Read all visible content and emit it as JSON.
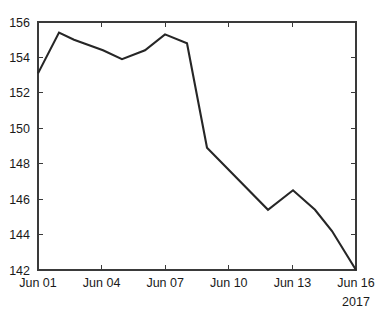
{
  "chart_data": {
    "type": "line",
    "title": "",
    "xlabel": "",
    "ylabel": "",
    "year_label": "2017",
    "grid": false,
    "legend": "none",
    "line_color": "#262626",
    "axis_color": "#3a3a3a",
    "background": "#ffffff",
    "xlim": [
      "Jun 01",
      "Jun 16"
    ],
    "ylim": [
      142,
      156
    ],
    "yticks": [
      142,
      144,
      146,
      148,
      150,
      152,
      154,
      156
    ],
    "ytick_labels": [
      "142",
      "144",
      "146",
      "148",
      "150",
      "152",
      "154",
      "156"
    ],
    "xticks": [
      "Jun 01",
      "Jun 04",
      "Jun 07",
      "Jun 10",
      "Jun 13",
      "Jun 16"
    ],
    "xtick_labels": [
      "Jun 01",
      "Jun 04",
      "Jun 07",
      "Jun 10",
      "Jun 13",
      "Jun 16"
    ],
    "x": [
      "Jun 01",
      "Jun 02",
      "Jun 03",
      "Jun 05",
      "Jun 06",
      "Jun 07",
      "Jun 08",
      "Jun 09",
      "Jun 10",
      "Jun 12",
      "Jun 13",
      "Jun 14",
      "Jun 15",
      "Jun 16"
    ],
    "values": [
      153.1,
      155.4,
      155.0,
      154.4,
      153.9,
      154.4,
      155.3,
      154.8,
      148.9,
      145.4,
      146.5,
      145.4,
      144.2,
      142.0
    ],
    "series": [
      {
        "name": "value",
        "values": [
          153.1,
          155.4,
          155.0,
          154.4,
          153.9,
          154.4,
          155.3,
          154.8,
          148.9,
          145.4,
          146.5,
          145.4,
          144.2,
          142.0
        ]
      }
    ],
    "points_px": [
      [
        38,
        73
      ],
      [
        59,
        32
      ],
      [
        74,
        40
      ],
      [
        103,
        50
      ],
      [
        122,
        58
      ],
      [
        145,
        49
      ],
      [
        165,
        34
      ],
      [
        187,
        43
      ],
      [
        207,
        147
      ],
      [
        268,
        212
      ],
      [
        293,
        192
      ],
      [
        315,
        216
      ],
      [
        332,
        233
      ],
      [
        356,
        270
      ]
    ],
    "plot_box_px": {
      "left": 38,
      "top": 22,
      "right": 356,
      "bottom": 270
    },
    "ytick_px": [
      270,
      234.6,
      199.1,
      163.7,
      128.3,
      92.9,
      57.4,
      22
    ],
    "xtick_px": [
      38,
      101.6,
      165.2,
      228.8,
      292.4,
      356
    ]
  }
}
